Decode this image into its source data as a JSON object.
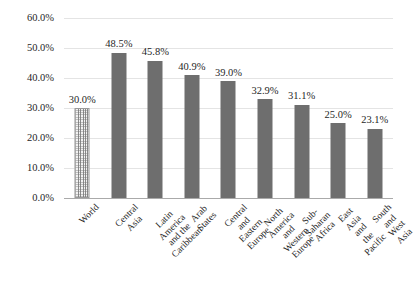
{
  "chart_data": {
    "type": "bar",
    "title": "",
    "subtitle": "",
    "xlabel": "",
    "ylabel": "",
    "ylim": [
      0,
      60
    ],
    "y_tick_labels": [
      "0.0%",
      "10.0%",
      "20.0%",
      "30.0%",
      "40.0%",
      "50.0%",
      "60.0%"
    ],
    "y_tick_values": [
      0,
      10,
      20,
      30,
      40,
      50,
      60
    ],
    "grid": true,
    "legend": "none",
    "categories": [
      "World",
      "Central Asia",
      "Latin America and the\nCaribbean",
      "Arab States",
      "Central and\nEastern Europe",
      "North America and\nWestern Europe",
      "Sub-Saharan Africa",
      "East Asia and the\nPacific",
      "South and West\nAsia"
    ],
    "values": [
      30.0,
      48.5,
      45.8,
      40.9,
      39.0,
      32.9,
      31.1,
      25.0,
      23.1
    ],
    "data_labels": [
      "30.0%",
      "48.5%",
      "45.8%",
      "40.9%",
      "39.0%",
      "32.9%",
      "31.1%",
      "25.0%",
      "23.1%"
    ],
    "bar_styles": [
      "hatched",
      "solid",
      "solid",
      "solid",
      "solid",
      "solid",
      "solid",
      "solid",
      "solid"
    ],
    "colors": {
      "bar_solid": "#6e6e6e",
      "bar_hatched_fill": "#f2f2f2",
      "bar_hatched_border": "#9a9a9a",
      "gridline": "#e4e4e4",
      "baseline": "#aaaaaa",
      "text": "#1f1f1f",
      "background": "#ffffff"
    }
  }
}
